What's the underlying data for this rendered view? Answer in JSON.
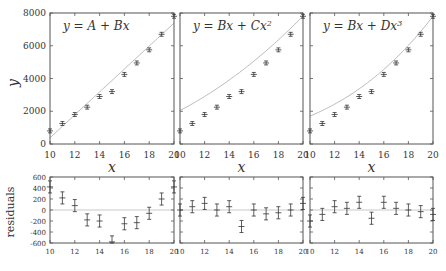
{
  "chart_data": [
    {
      "type": "scatter",
      "panel": "fit-linear",
      "title": "y = A + Bx",
      "xlabel": "x",
      "ylabel": "y",
      "xlim": [
        10,
        20
      ],
      "ylim": [
        0,
        8000
      ],
      "xticks": [
        10,
        12,
        14,
        16,
        18,
        20
      ],
      "yticks": [
        0,
        2000,
        4000,
        6000,
        8000
      ],
      "x": [
        10,
        11,
        12,
        13,
        14,
        15,
        16,
        17,
        18,
        19,
        20
      ],
      "y": [
        800,
        1250,
        1800,
        2250,
        2900,
        3200,
        4250,
        4950,
        5750,
        6700,
        7800
      ],
      "yerr": 120,
      "fit": {
        "kind": "linear",
        "points": [
          [
            10,
            380
          ],
          [
            20,
            7380
          ]
        ]
      }
    },
    {
      "type": "scatter",
      "panel": "fit-quadratic",
      "title": "y = Bx + Cx^2",
      "xlabel": "x",
      "xlim": [
        10,
        20
      ],
      "ylim": [
        0,
        8000
      ],
      "xticks": [
        10,
        12,
        14,
        16,
        18,
        20
      ],
      "x": [
        10,
        11,
        12,
        13,
        14,
        15,
        16,
        17,
        18,
        19,
        20
      ],
      "y": [
        800,
        1250,
        1800,
        2250,
        2900,
        3200,
        4250,
        4950,
        5750,
        6700,
        7800
      ],
      "yerr": 120,
      "fit": {
        "kind": "quadratic",
        "B": 18.5,
        "C": 18.6
      }
    },
    {
      "type": "scatter",
      "panel": "fit-cubic",
      "title": "y = Bx + Dx^3",
      "xlabel": "x",
      "xlim": [
        10,
        20
      ],
      "ylim": [
        0,
        8000
      ],
      "xticks": [
        10,
        12,
        14,
        16,
        18,
        20
      ],
      "x": [
        10,
        11,
        12,
        13,
        14,
        15,
        16,
        17,
        18,
        19,
        20
      ],
      "y": [
        800,
        1250,
        1800,
        2250,
        2900,
        3200,
        4250,
        4950,
        5750,
        6700,
        7800
      ],
      "yerr": 120,
      "fit": {
        "kind": "cubic",
        "B": 97.0,
        "D": 0.733
      }
    },
    {
      "type": "scatter",
      "panel": "residuals-linear",
      "ylabel": "residuals",
      "xlim": [
        10,
        20
      ],
      "ylim": [
        -600,
        600
      ],
      "xticks": [
        10,
        12,
        14,
        16,
        18,
        20
      ],
      "yticks": [
        -600,
        -400,
        -200,
        0,
        200,
        400,
        600
      ],
      "x": [
        10,
        11,
        12,
        13,
        14,
        15,
        16,
        17,
        18,
        19,
        20
      ],
      "y": [
        420,
        220,
        80,
        -180,
        -200,
        -580,
        -250,
        -230,
        -60,
        200,
        420
      ],
      "yerr": 110
    },
    {
      "type": "scatter",
      "panel": "residuals-quadratic",
      "xlim": [
        10,
        20
      ],
      "ylim": [
        -600,
        600
      ],
      "xticks": [
        10,
        12,
        14,
        16,
        18,
        20
      ],
      "x": [
        10,
        11,
        12,
        13,
        14,
        15,
        16,
        17,
        18,
        19,
        20
      ],
      "y": [
        0,
        60,
        120,
        0,
        60,
        -300,
        0,
        -70,
        -50,
        0,
        120
      ],
      "yerr": 110
    },
    {
      "type": "scatter",
      "panel": "residuals-cubic",
      "xlim": [
        10,
        20
      ],
      "ylim": [
        -600,
        600
      ],
      "xticks": [
        10,
        12,
        14,
        16,
        18,
        20
      ],
      "x": [
        10,
        11,
        12,
        13,
        14,
        15,
        16,
        17,
        18,
        19,
        20
      ],
      "y": [
        -200,
        -80,
        60,
        30,
        140,
        -150,
        140,
        30,
        0,
        -30,
        -80
      ],
      "yerr": 110
    }
  ],
  "labels": {
    "y_axis": "y",
    "x_axis": "x",
    "residuals_axis": "residuals"
  },
  "colors": {
    "frame": "#555555",
    "data": "#333333",
    "fit_line": "#bbbbbb",
    "zero_line": "#bbbbbb"
  }
}
